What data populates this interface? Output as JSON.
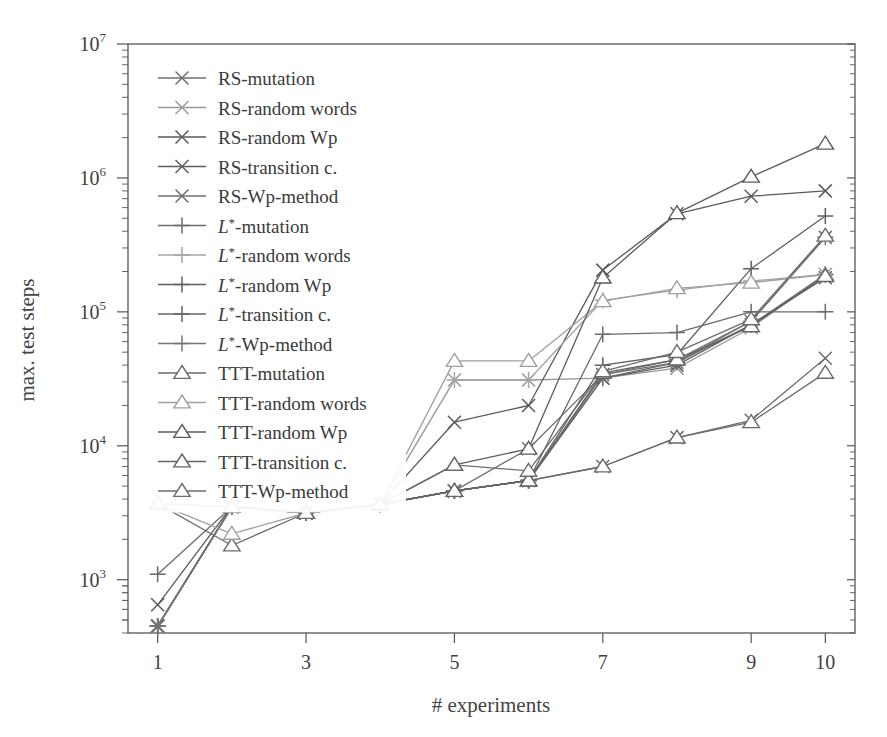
{
  "chart_data": {
    "type": "line",
    "title": "",
    "xlabel": "# experiments",
    "ylabel": "max. test steps",
    "xlim": [
      0.6,
      10.4
    ],
    "ylim": [
      400,
      10000000
    ],
    "yscale": "log",
    "grid": false,
    "legend_position": "upper-left-inside",
    "x_ticks": [
      1,
      3,
      5,
      7,
      9,
      10
    ],
    "x_tick_labels": [
      "1",
      "3",
      "5",
      "7",
      "9",
      "10"
    ],
    "y_ticks": [
      1000,
      10000,
      100000,
      1000000,
      10000000
    ],
    "y_tick_labels": [
      "10³",
      "10⁴",
      "10⁵",
      "10⁶",
      "10⁷"
    ],
    "x": [
      1,
      2,
      3,
      4,
      5,
      6,
      7,
      8,
      9,
      10
    ],
    "series": [
      {
        "name": "RS-mutation",
        "marker": "x",
        "color": "#6f6f6f",
        "values": [
          450,
          3500,
          3150,
          3650,
          4600,
          5500,
          7000,
          11500,
          15500,
          45000
        ]
      },
      {
        "name": "RS-random words",
        "marker": "x",
        "color": "#9a9a9a",
        "values": [
          450,
          3550,
          3150,
          3650,
          31000,
          31000,
          32000,
          38000,
          76000,
          190000
        ]
      },
      {
        "name": "RS-random Wp",
        "marker": "x",
        "color": "#5a5a5a",
        "values": [
          650,
          3550,
          3150,
          3650,
          15000,
          20000,
          205000,
          540000,
          730000,
          800000
        ]
      },
      {
        "name": "RS-transition c.",
        "marker": "x",
        "color": "#5e5e5e",
        "values": [
          450,
          3500,
          3150,
          3650,
          4600,
          5500,
          32000,
          40000,
          80000,
          180000
        ]
      },
      {
        "name": "RS-Wp-method",
        "marker": "x",
        "color": "#707070",
        "values": [
          450,
          3500,
          3150,
          3650,
          4600,
          9500,
          34000,
          42000,
          85000,
          360000
        ]
      },
      {
        "name": "L*-mutation",
        "marker": "plus",
        "color": "#6b6b6b",
        "values": [
          1100,
          3500,
          3150,
          3650,
          4600,
          5500,
          68000,
          70000,
          100000,
          100000
        ]
      },
      {
        "name": "L*-random words",
        "marker": "plus",
        "color": "#a5a5a5",
        "values": [
          450,
          3500,
          3150,
          3650,
          31000,
          31000,
          122000,
          145000,
          170000,
          190000
        ]
      },
      {
        "name": "L*-random Wp",
        "marker": "plus",
        "color": "#606060",
        "values": [
          450,
          3500,
          3150,
          3650,
          4600,
          5500,
          40000,
          48000,
          210000,
          520000
        ]
      },
      {
        "name": "L*-transition c.",
        "marker": "plus",
        "color": "#666666",
        "values": [
          450,
          3500,
          3150,
          3650,
          4600,
          5500,
          32000,
          42000,
          80000,
          190000
        ]
      },
      {
        "name": "L*-Wp-method",
        "marker": "plus",
        "color": "#757575",
        "values": [
          450,
          3500,
          3150,
          3650,
          4600,
          5500,
          34000,
          44000,
          85000,
          360000
        ]
      },
      {
        "name": "TTT-mutation",
        "marker": "triangle",
        "color": "#6a6a6a",
        "values": [
          3700,
          1800,
          3150,
          3650,
          4600,
          5500,
          7000,
          11500,
          15000,
          35000
        ]
      },
      {
        "name": "TTT-random words",
        "marker": "triangle",
        "color": "#a0a0a0",
        "values": [
          3700,
          2200,
          3150,
          3650,
          43000,
          43000,
          120000,
          150000,
          165000,
          190000
        ]
      },
      {
        "name": "TTT-random Wp",
        "marker": "triangle",
        "color": "#5c5c5c",
        "values": [
          3700,
          3500,
          3150,
          3650,
          7200,
          9500,
          180000,
          545000,
          1020000,
          1800000
        ]
      },
      {
        "name": "TTT-transition c.",
        "marker": "triangle",
        "color": "#636363",
        "values": [
          3700,
          3500,
          3150,
          3650,
          4600,
          5500,
          35000,
          44000,
          78000,
          185000
        ]
      },
      {
        "name": "TTT-Wp-method",
        "marker": "triangle",
        "color": "#6d6d6d",
        "values": [
          3700,
          3500,
          3150,
          3650,
          7200,
          6500,
          36000,
          50000,
          88000,
          370000
        ]
      }
    ]
  },
  "axes": {
    "xlabel": "# experiments",
    "ylabel": "max. test steps"
  },
  "legend": {
    "items": [
      {
        "label": "RS-mutation",
        "marker": "x"
      },
      {
        "label": "RS-random words",
        "marker": "x"
      },
      {
        "label": "RS-random Wp",
        "marker": "x"
      },
      {
        "label": "RS-transition c.",
        "marker": "x"
      },
      {
        "label": "RS-Wp-method",
        "marker": "x"
      },
      {
        "label": "L*-mutation",
        "marker": "plus",
        "italic_prefix": "L*"
      },
      {
        "label": "L*-random words",
        "marker": "plus",
        "italic_prefix": "L*"
      },
      {
        "label": "L*-random Wp",
        "marker": "plus",
        "italic_prefix": "L*"
      },
      {
        "label": "L*-transition c.",
        "marker": "plus",
        "italic_prefix": "L*"
      },
      {
        "label": "L*-Wp-method",
        "marker": "plus",
        "italic_prefix": "L*"
      },
      {
        "label": "TTT-mutation",
        "marker": "triangle"
      },
      {
        "label": "TTT-random words",
        "marker": "triangle"
      },
      {
        "label": "TTT-random Wp",
        "marker": "triangle"
      },
      {
        "label": "TTT-transition c.",
        "marker": "triangle"
      },
      {
        "label": "TTT-Wp-method",
        "marker": "triangle"
      }
    ]
  }
}
